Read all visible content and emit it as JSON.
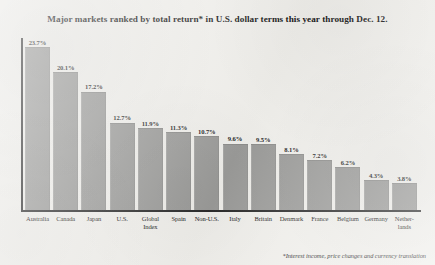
{
  "chart_data": {
    "type": "bar",
    "title": "Major markets ranked by total return* in U.S. dollar terms this year through Dec. 12.",
    "xlabel": "",
    "ylabel": "",
    "ylim": [
      0,
      23.7
    ],
    "grid": false,
    "legend": null,
    "footnote": "*Interest income, price changes and currency translation",
    "value_suffix": "%",
    "categories": [
      "Australia",
      "Canada",
      "Japan",
      "U.S.",
      "Global Index",
      "Spain",
      "Non-U.S.",
      "Italy",
      "Britain",
      "Denmark",
      "France",
      "Belgium",
      "Germany",
      "Netherlands"
    ],
    "values": [
      23.7,
      20.1,
      17.2,
      12.7,
      11.9,
      11.3,
      10.7,
      9.6,
      9.5,
      8.1,
      7.2,
      6.2,
      4.3,
      3.8
    ],
    "bars": [
      {
        "category_line1": "Australia",
        "category_line2": "",
        "value": 23.7,
        "label": "23.7%"
      },
      {
        "category_line1": "Canada",
        "category_line2": "",
        "value": 20.1,
        "label": "20.1%"
      },
      {
        "category_line1": "Japan",
        "category_line2": "",
        "value": 17.2,
        "label": "17.2%"
      },
      {
        "category_line1": "U.S.",
        "category_line2": "",
        "value": 12.7,
        "label": "12.7%"
      },
      {
        "category_line1": "Global",
        "category_line2": "Index",
        "value": 11.9,
        "label": "11.9%"
      },
      {
        "category_line1": "Spain",
        "category_line2": "",
        "value": 11.3,
        "label": "11.3%"
      },
      {
        "category_line1": "Non-U.S.",
        "category_line2": "",
        "value": 10.7,
        "label": "10.7%"
      },
      {
        "category_line1": "Italy",
        "category_line2": "",
        "value": 9.6,
        "label": "9.6%"
      },
      {
        "category_line1": "Britain",
        "category_line2": "",
        "value": 9.5,
        "label": "9.5%"
      },
      {
        "category_line1": "Denmark",
        "category_line2": "",
        "value": 8.1,
        "label": "8.1%"
      },
      {
        "category_line1": "France",
        "category_line2": "",
        "value": 7.2,
        "label": "7.2%"
      },
      {
        "category_line1": "Belgium",
        "category_line2": "",
        "value": 6.2,
        "label": "6.2%"
      },
      {
        "category_line1": "Germany",
        "category_line2": "",
        "value": 4.3,
        "label": "4.3%"
      },
      {
        "category_line1": "Nether-",
        "category_line2": "lands",
        "value": 3.8,
        "label": "3.8%"
      }
    ]
  },
  "colors": {
    "paper": "#f1f0ec",
    "bar_fill": "#9c9c9a",
    "axis": "#2b2b2b",
    "text": "#1a1a1a"
  }
}
